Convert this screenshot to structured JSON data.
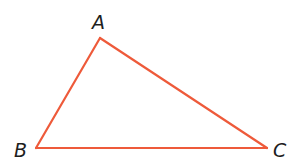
{
  "diagram": {
    "type": "triangle",
    "stroke_color": "#ee5a3a",
    "label_color": "#1e1e1e",
    "vertices": [
      {
        "name": "A"
      },
      {
        "name": "B"
      },
      {
        "name": "C"
      }
    ],
    "edges": [
      {
        "from": "A",
        "to": "B"
      },
      {
        "from": "B",
        "to": "C"
      },
      {
        "from": "C",
        "to": "A"
      }
    ]
  }
}
